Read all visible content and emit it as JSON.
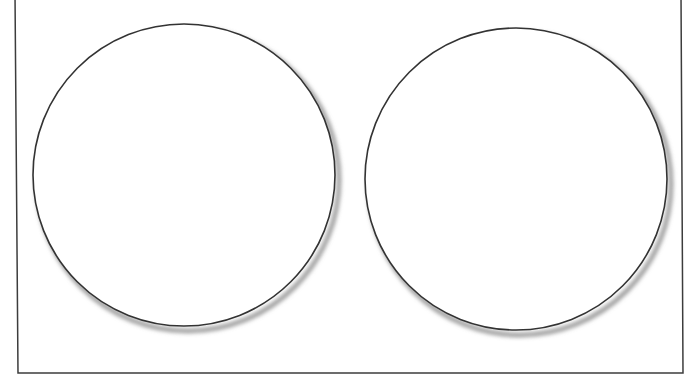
{
  "figure": {
    "title": "Two circles inside a rectangular frame",
    "background_color": "#ffffff",
    "width": 697,
    "height": 380,
    "frame": {
      "name": "rectangular-frame",
      "stroke_color": "#3c3c3c",
      "stroke_width": 1.5,
      "fill_color": "#ffffff",
      "top_edge_cropped": true,
      "points": "15,-6 681,-6 683,373 18,373",
      "description": "Slightly skewed rectangle outline; top edge lies above the visible area"
    },
    "shapes": [
      {
        "name": "left-circle",
        "label": "Left circle",
        "cx": 184,
        "cy": 175,
        "r": 151,
        "stroke_color": "#333333",
        "stroke_width": 1.6,
        "fill_color": "#ffffff",
        "shadow_color": "#8d8d8d",
        "shadow_offset_x": 4,
        "shadow_offset_y": 5
      },
      {
        "name": "right-circle",
        "label": "Right circle",
        "cx": 516,
        "cy": 179,
        "r": 151,
        "stroke_color": "#333333",
        "stroke_width": 1.6,
        "fill_color": "#ffffff",
        "shadow_color": "#8d8d8d",
        "shadow_offset_x": 4,
        "shadow_offset_y": 5
      }
    ]
  }
}
